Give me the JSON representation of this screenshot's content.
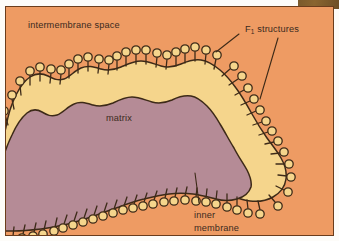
{
  "figure": {
    "colors": {
      "panel_background": "#ee9b63",
      "panel_border": "#6b3d1c",
      "matrix_fill": "#b58b96",
      "membrane_fill": "#f5d58c",
      "outline": "#3d2a18",
      "label_text": "#3a2a20",
      "page_background": "#fdfcf9",
      "corner_artifact": "#7a5a2c"
    }
  },
  "labels": {
    "intermembrane_space": "intermembrane space",
    "f1_structures_prefix": "F",
    "f1_structures_subscript": "1",
    "f1_structures_suffix": " structures",
    "matrix": "matrix",
    "inner_membrane_line1": "inner",
    "inner_membrane_line2": "membrane"
  },
  "structures": {
    "membrane_band": "wavy cream-colored inner membrane band enclosing the matrix",
    "matrix_region": "mauve interior region labelled matrix",
    "f1_particles": "circular knob on short stalk projecting outward from the membrane into the intermembrane space",
    "f1_particle_count": 62
  },
  "leader_lines": {
    "f1_upper": "from F1 label down-left to particles on upper membrane",
    "f1_lower": "from F1 label down-left to particles on right membrane curve",
    "inner_membrane": "from inner membrane label up into the membrane band"
  }
}
